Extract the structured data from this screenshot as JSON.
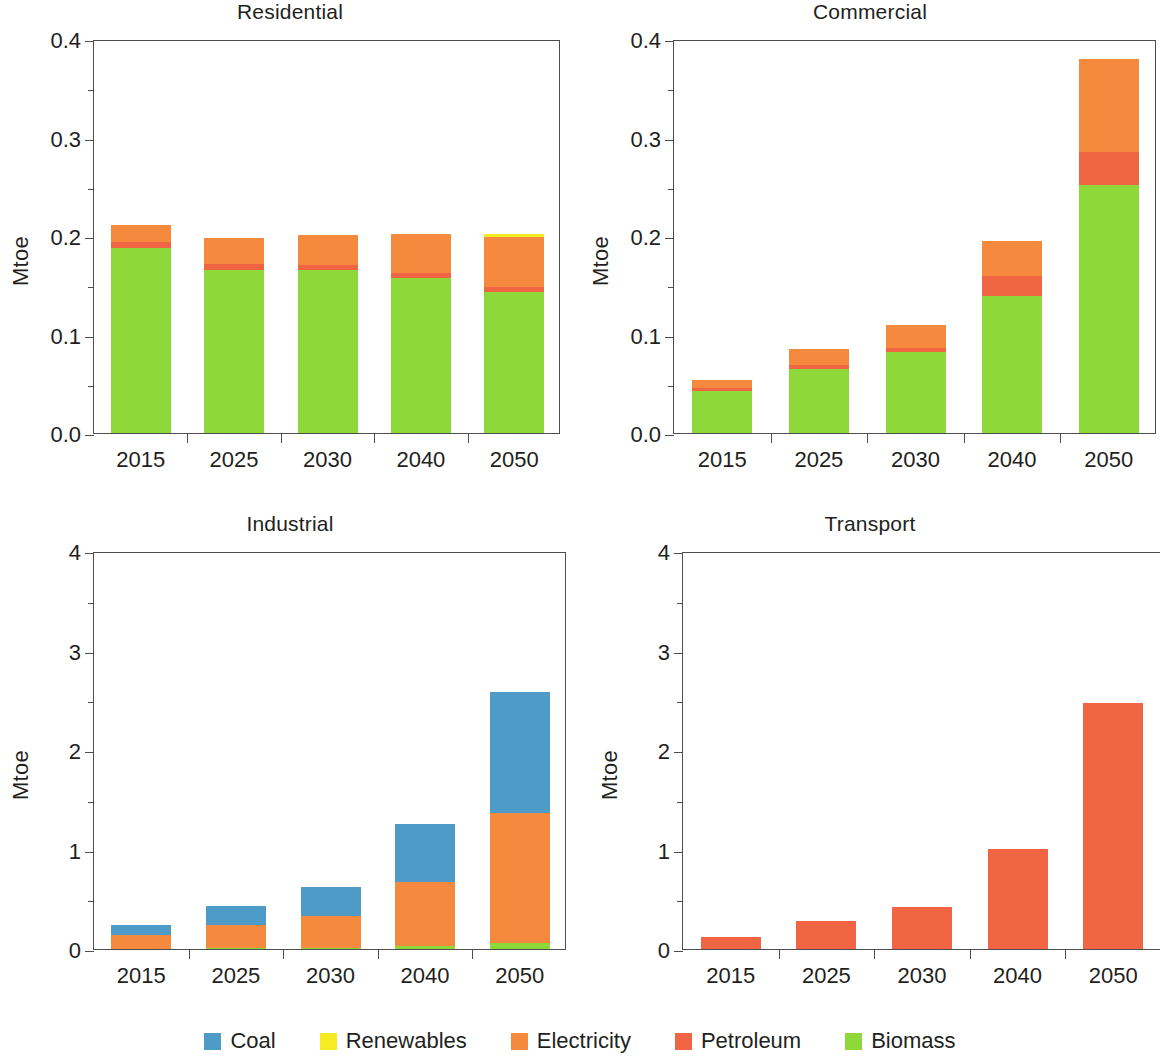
{
  "figure": {
    "units": "Mtoe",
    "categories": [
      "2015",
      "2025",
      "2030",
      "2040",
      "2050"
    ]
  },
  "series_colors": {
    "Coal": "#4e9bc8",
    "Renewables": "#f7ec23",
    "Electricity": "#f5893d",
    "Petroleum": "#f06543",
    "Biomass": "#8ed83a"
  },
  "legend": {
    "items": [
      {
        "label": "Coal",
        "color": "#4e9bc8",
        "swatch": "coal-swatch"
      },
      {
        "label": "Renewables",
        "color": "#f7ec23",
        "swatch": "renewables-swatch"
      },
      {
        "label": "Electricity",
        "color": "#f5893d",
        "swatch": "electricity-swatch"
      },
      {
        "label": "Petroleum",
        "color": "#f06543",
        "swatch": "petroleum-swatch"
      },
      {
        "label": "Biomass",
        "color": "#8ed83a",
        "swatch": "biomass-swatch"
      }
    ]
  },
  "panels": [
    {
      "key": "residential",
      "title": "Residential",
      "ylabel": "Mtoe",
      "yticks": [
        "0.0",
        "0.1",
        "0.2",
        "0.3",
        "0.4"
      ],
      "xticks": [
        "2015",
        "2025",
        "2030",
        "2040",
        "2050"
      ]
    },
    {
      "key": "commercial",
      "title": "Commercial",
      "ylabel": "Mtoe",
      "yticks": [
        "0.0",
        "0.1",
        "0.2",
        "0.3",
        "0.4"
      ],
      "xticks": [
        "2015",
        "2025",
        "2030",
        "2040",
        "2050"
      ]
    },
    {
      "key": "industrial",
      "title": "Industrial",
      "ylabel": "Mtoe",
      "yticks": [
        "0",
        "1",
        "2",
        "3",
        "4"
      ],
      "xticks": [
        "2015",
        "2025",
        "2030",
        "2040",
        "2050"
      ]
    },
    {
      "key": "transport",
      "title": "Transport",
      "ylabel": "Mtoe",
      "yticks": [
        "0",
        "1",
        "2",
        "3",
        "4"
      ],
      "xticks": [
        "2015",
        "2025",
        "2030",
        "2040",
        "2050"
      ]
    }
  ],
  "chart_data": [
    {
      "type": "bar",
      "stacked": true,
      "title": "Residential",
      "xlabel": "",
      "ylabel": "Mtoe",
      "ylim": [
        0.0,
        0.4
      ],
      "ytick_values": [
        0.0,
        0.1,
        0.2,
        0.3,
        0.4
      ],
      "yminor_step": 0.05,
      "grid": false,
      "legend_position": "bottom-figure",
      "categories": [
        "2015",
        "2025",
        "2030",
        "2040",
        "2050"
      ],
      "series": [
        {
          "name": "Biomass",
          "values": [
            0.188,
            0.166,
            0.165,
            0.157,
            0.143
          ]
        },
        {
          "name": "Petroleum",
          "values": [
            0.006,
            0.006,
            0.006,
            0.005,
            0.005
          ]
        },
        {
          "name": "Electricity",
          "values": [
            0.017,
            0.026,
            0.03,
            0.04,
            0.051
          ]
        },
        {
          "name": "Renewables",
          "values": [
            0.0,
            0.0,
            0.0,
            0.0,
            0.003
          ]
        },
        {
          "name": "Coal",
          "values": [
            0.0,
            0.0,
            0.0,
            0.0,
            0.0
          ]
        }
      ],
      "totals": [
        0.211,
        0.198,
        0.201,
        0.202,
        0.202
      ]
    },
    {
      "type": "bar",
      "stacked": true,
      "title": "Commercial",
      "xlabel": "",
      "ylabel": "Mtoe",
      "ylim": [
        0.0,
        0.4
      ],
      "ytick_values": [
        0.0,
        0.1,
        0.2,
        0.3,
        0.4
      ],
      "yminor_step": 0.05,
      "grid": false,
      "legend_position": "bottom-figure",
      "categories": [
        "2015",
        "2025",
        "2030",
        "2040",
        "2050"
      ],
      "series": [
        {
          "name": "Biomass",
          "values": [
            0.043,
            0.065,
            0.082,
            0.139,
            0.252
          ]
        },
        {
          "name": "Petroleum",
          "values": [
            0.003,
            0.004,
            0.004,
            0.02,
            0.033
          ]
        },
        {
          "name": "Electricity",
          "values": [
            0.008,
            0.016,
            0.024,
            0.036,
            0.095
          ]
        },
        {
          "name": "Renewables",
          "values": [
            0.0,
            0.0,
            0.0,
            0.0,
            0.0
          ]
        },
        {
          "name": "Coal",
          "values": [
            0.0,
            0.0,
            0.0,
            0.0,
            0.0
          ]
        }
      ],
      "totals": [
        0.054,
        0.085,
        0.11,
        0.195,
        0.38
      ]
    },
    {
      "type": "bar",
      "stacked": true,
      "title": "Industrial",
      "xlabel": "",
      "ylabel": "Mtoe",
      "ylim": [
        0,
        4
      ],
      "ytick_values": [
        0,
        1,
        2,
        3,
        4
      ],
      "yminor_step": 0.5,
      "grid": false,
      "legend_position": "bottom-figure",
      "categories": [
        "2015",
        "2025",
        "2030",
        "2040",
        "2050"
      ],
      "series": [
        {
          "name": "Biomass",
          "values": [
            0.0,
            0.01,
            0.01,
            0.03,
            0.06
          ]
        },
        {
          "name": "Electricity",
          "values": [
            0.14,
            0.23,
            0.32,
            0.64,
            1.31
          ]
        },
        {
          "name": "Coal",
          "values": [
            0.1,
            0.19,
            0.29,
            0.59,
            1.21
          ]
        },
        {
          "name": "Petroleum",
          "values": [
            0.0,
            0.0,
            0.0,
            0.0,
            0.0
          ]
        },
        {
          "name": "Renewables",
          "values": [
            0.0,
            0.0,
            0.0,
            0.0,
            0.0
          ]
        }
      ],
      "totals": [
        0.24,
        0.43,
        0.62,
        1.26,
        2.58
      ]
    },
    {
      "type": "bar",
      "stacked": true,
      "title": "Transport",
      "xlabel": "",
      "ylabel": "Mtoe",
      "ylim": [
        0,
        4
      ],
      "ytick_values": [
        0,
        1,
        2,
        3,
        4
      ],
      "yminor_step": 0.5,
      "grid": false,
      "legend_position": "bottom-figure",
      "categories": [
        "2015",
        "2025",
        "2030",
        "2040",
        "2050"
      ],
      "series": [
        {
          "name": "Petroleum",
          "values": [
            0.12,
            0.28,
            0.42,
            1.01,
            2.47
          ]
        },
        {
          "name": "Electricity",
          "values": [
            0.0,
            0.0,
            0.0,
            0.0,
            0.0
          ]
        },
        {
          "name": "Coal",
          "values": [
            0.0,
            0.0,
            0.0,
            0.0,
            0.0
          ]
        },
        {
          "name": "Renewables",
          "values": [
            0.0,
            0.0,
            0.0,
            0.0,
            0.0
          ]
        },
        {
          "name": "Biomass",
          "values": [
            0.0,
            0.0,
            0.0,
            0.0,
            0.0
          ]
        }
      ],
      "totals": [
        0.12,
        0.28,
        0.42,
        1.01,
        2.47
      ]
    }
  ]
}
